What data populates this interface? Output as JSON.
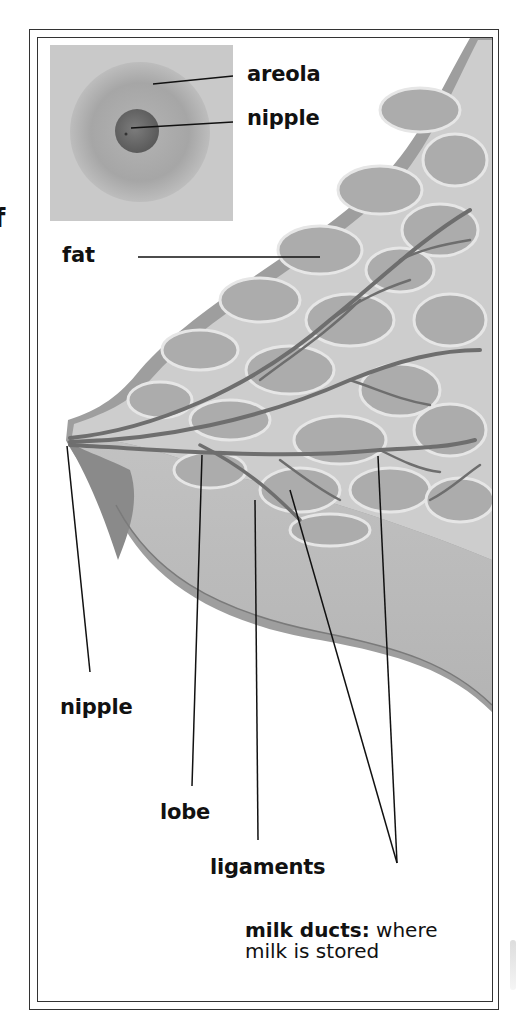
{
  "figure": {
    "partial_left_text": "f",
    "inset_labels": {
      "areola": "areola",
      "nipple": "nipple"
    },
    "labels": {
      "fat": "fat",
      "nipple": "nipple",
      "lobe": "lobe",
      "ligaments": "ligaments",
      "milk_ducts_term": "milk ducts:",
      "milk_ducts_desc_1": "where",
      "milk_ducts_desc_2": "milk is stored"
    },
    "colors": {
      "frame": "#333333",
      "skin": "#9a9a9a",
      "tissue": "#c4c4c4",
      "lobule": "#a8a8a8",
      "duct": "#6e6e6e",
      "inset_bg": "#c8c8c8",
      "areola": "#a0a0a0",
      "nipple": "#6a6a6a"
    }
  }
}
